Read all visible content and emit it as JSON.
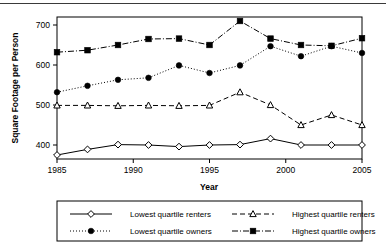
{
  "chart_data": {
    "type": "line",
    "title": "",
    "xlabel": "Year",
    "ylabel": "Square Footage per Person",
    "x": [
      1985,
      1987,
      1989,
      1991,
      1993,
      1995,
      1997,
      1999,
      2001,
      2003,
      2005
    ],
    "xlim": [
      1985,
      2005
    ],
    "ylim": [
      365,
      720
    ],
    "xticks": [
      1985,
      1990,
      1995,
      2000,
      2005
    ],
    "xticklabels": [
      "1985",
      "1990",
      "1995",
      "2000",
      "2005"
    ],
    "yticks": [
      400,
      500,
      600,
      700
    ],
    "yticklabels": [
      "400",
      "500",
      "600",
      "700"
    ],
    "grid": false,
    "legend_position": "below-axes",
    "series": [
      {
        "name": "Lowest quartile renters",
        "marker": "open-diamond",
        "linestyle": "solid",
        "color": "#000000",
        "values": [
          375,
          389,
          401,
          400,
          396,
          400,
          401,
          416,
          400,
          400,
          400
        ]
      },
      {
        "name": "Lowest quartile owners",
        "marker": "filled-circle",
        "linestyle": "dotted",
        "color": "#000000",
        "values": [
          532,
          548,
          563,
          568,
          599,
          580,
          599,
          647,
          622,
          647,
          630
        ]
      },
      {
        "name": "Highest quartile renters",
        "marker": "open-triangle",
        "linestyle": "dashed",
        "color": "#000000",
        "values": [
          499,
          499,
          498,
          499,
          498,
          499,
          532,
          500,
          450,
          475,
          450
        ]
      },
      {
        "name": "Highest quartile owners",
        "marker": "filled-square",
        "linestyle": "dash-dot",
        "color": "#000000",
        "values": [
          632,
          637,
          650,
          665,
          666,
          650,
          710,
          666,
          650,
          648,
          667
        ]
      }
    ]
  },
  "legend": {
    "entries": [
      {
        "label": "Lowest quartile renters"
      },
      {
        "label": "Highest quartile renters"
      },
      {
        "label": "Lowest quartile owners"
      },
      {
        "label": "Highest quartile owners"
      }
    ]
  }
}
